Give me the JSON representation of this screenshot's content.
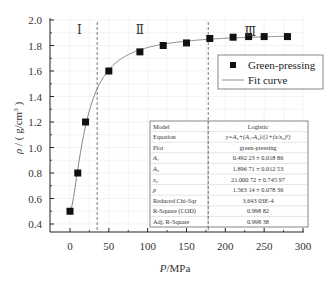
{
  "chart_data": {
    "type": "scatter",
    "title": "",
    "xlabel": "P/MPa",
    "ylabel": "ρ / ( g/cm³ )",
    "xlim": [
      -25,
      300
    ],
    "ylim": [
      0.3,
      2.0
    ],
    "xticks": [
      0,
      50,
      100,
      150,
      200,
      250,
      300
    ],
    "yticks": [
      0.4,
      0.6,
      0.8,
      1.0,
      1.2,
      1.4,
      1.6,
      1.8,
      2.0
    ],
    "grid": true,
    "legend_position": "upper right",
    "series": [
      {
        "name": "Green-pressing",
        "kind": "scatter",
        "marker": "square",
        "color": "#111111",
        "x": [
          0,
          10,
          20,
          50,
          90,
          120,
          150,
          180,
          210,
          230,
          250,
          280
        ],
        "y": [
          0.5,
          0.8,
          1.2,
          1.6,
          1.75,
          1.8,
          1.82,
          1.855,
          1.865,
          1.87,
          1.87,
          1.87
        ]
      },
      {
        "name": "Fit curve",
        "kind": "line",
        "color": "#777777",
        "model": "Logistic",
        "params": {
          "A1": 0.49223,
          "A2": 1.89671,
          "x0": 21.00072,
          "p": 1.56314
        }
      }
    ],
    "region_dividers": [
      {
        "x": 35,
        "style": "dashed"
      },
      {
        "x": 178,
        "style": "dashed"
      }
    ],
    "region_labels": [
      {
        "label": "Ⅰ",
        "x": 12,
        "y": 1.93
      },
      {
        "label": "Ⅱ",
        "x": 90,
        "y": 1.93
      },
      {
        "label": "Ⅲ",
        "x": 232,
        "y": 1.91
      }
    ],
    "fit_table": {
      "rows": [
        {
          "key": "Model",
          "value": "Logistic"
        },
        {
          "key": "Equation",
          "value": "y=A₂+(A₁-A₂)/(1+(x/x₀)ᵖ)"
        },
        {
          "key": "Plot",
          "value": "green-pressing"
        },
        {
          "key": "A₁",
          "value": "0.492 23 ± 0.018 86"
        },
        {
          "key": "A₂",
          "value": "1.896 71 ± 0.012 53"
        },
        {
          "key": "x₀",
          "value": "21.000 72 ± 0.745 97"
        },
        {
          "key": "p",
          "value": "1.563 14 ± 0.078 36"
        },
        {
          "key": "Reduced Chi-Sqr",
          "value": "3.643 03E-4"
        },
        {
          "key": "R-Square (COD)",
          "value": "0.998 82"
        },
        {
          "key": "Adj. R-Square",
          "value": "0.998 38"
        }
      ]
    }
  },
  "labels": {
    "xlabel": "P/MPa",
    "ylabel": "ρ / ( g/cm³ )",
    "legend_scatter": "Green-pressing",
    "legend_line": "Fit curve"
  }
}
